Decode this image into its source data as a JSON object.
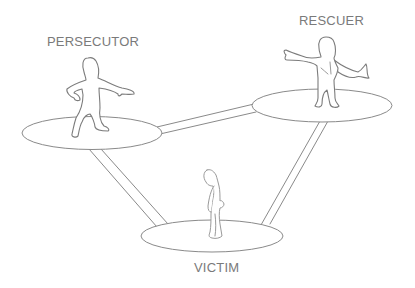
{
  "diagram": {
    "roles": [
      {
        "id": "persecutor",
        "label": "PERSECUTOR",
        "position": "top-left",
        "pose": "hand on hip, pointing finger"
      },
      {
        "id": "rescuer",
        "label": "RESCUER",
        "position": "top-right",
        "pose": "arm outstretched, wearing cape"
      },
      {
        "id": "victim",
        "label": "VICTIM",
        "position": "bottom-center",
        "pose": "slumped, head down"
      }
    ],
    "connections": [
      {
        "from": "persecutor",
        "to": "rescuer"
      },
      {
        "from": "persecutor",
        "to": "victim"
      },
      {
        "from": "rescuer",
        "to": "victim"
      }
    ],
    "colors": {
      "background": "#ffffff",
      "stroke": "#8a8a8a",
      "label": "#7a7a7a"
    }
  }
}
